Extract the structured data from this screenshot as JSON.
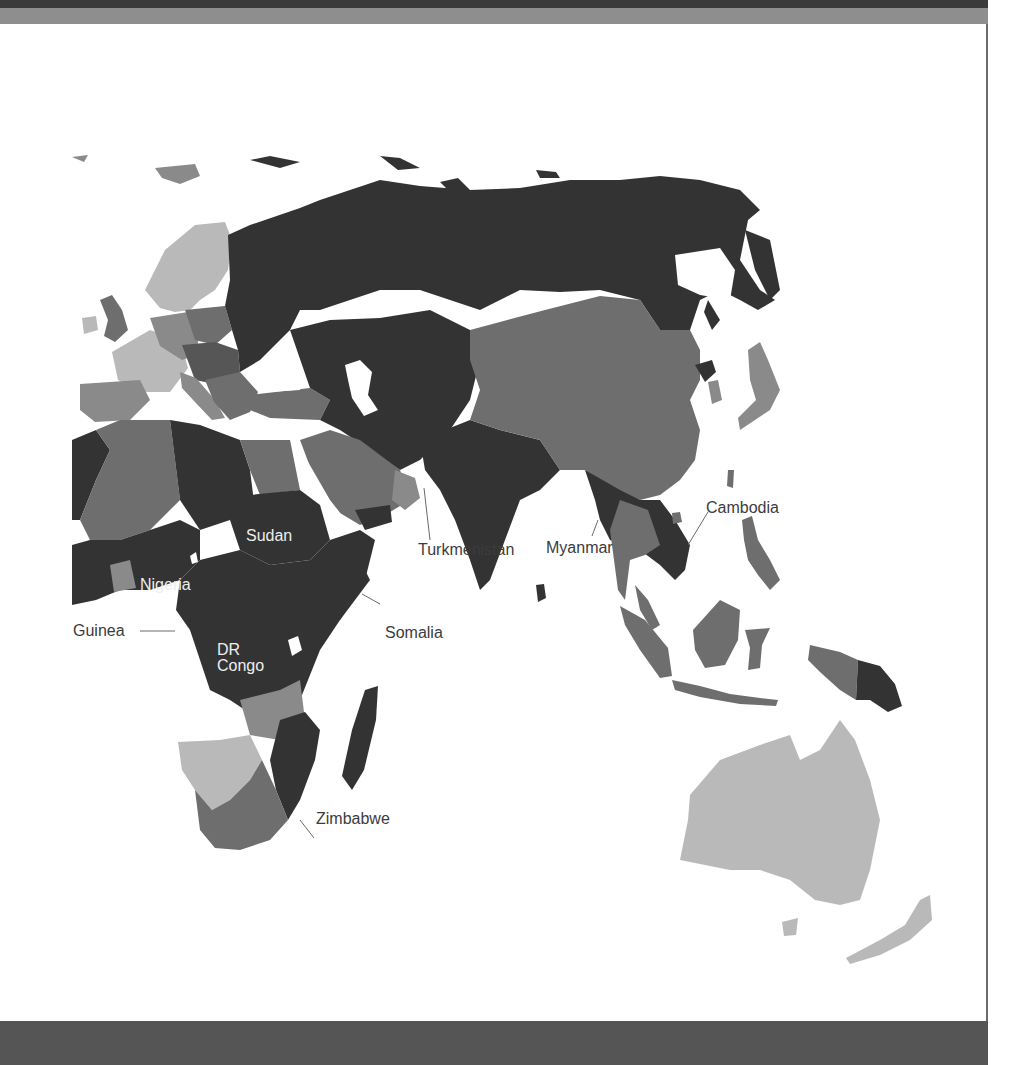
{
  "map": {
    "type": "choropleth",
    "palette": {
      "darkest": "#333333",
      "dark": "#565656",
      "medium": "#6e6e6e",
      "light": "#8a8a8a",
      "lightest": "#b9b9b9",
      "water": "#ffffff"
    },
    "labels": {
      "turkmenistan": "Turkmenistan",
      "myanmar": "Myanmar",
      "cambodia": "Cambodia",
      "sudan": "Sudan",
      "nigeria": "Nigeria",
      "guinea": "Guinea",
      "dr_congo_line1": "DR",
      "dr_congo_line2": "Congo",
      "somalia": "Somalia",
      "zimbabwe": "Zimbabwe"
    },
    "regions_shown": [
      "Europe",
      "Russia",
      "Central Asia",
      "Middle East",
      "South Asia",
      "East Asia",
      "Southeast Asia",
      "Africa",
      "Oceania"
    ]
  },
  "colors": {
    "header_dark": "#3a3a3a",
    "header_band": "#8e8e8e",
    "footer_band": "#555555",
    "frame_border": "#6b6b6b"
  }
}
